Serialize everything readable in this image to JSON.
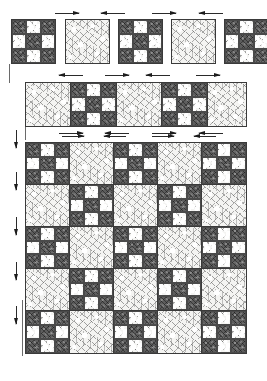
{
  "diagram": {
    "fabrics": {
      "light_label": "light mottled print",
      "light_color": "#f4f4f2",
      "dark_label": "dark speckled print",
      "dark_color": "#5d5d5d",
      "outline_color": "#3a3a3a"
    },
    "block_types": {
      "nine_patch": "nine-patch block",
      "plain": "plain setting square"
    },
    "step_1": {
      "name": "individual blocks row",
      "block_count": 5,
      "sequence": [
        "nine-patch",
        "plain",
        "nine-patch",
        "plain",
        "nine-patch"
      ],
      "arrow_count": 4,
      "arrow_directions": [
        "right",
        "left",
        "right",
        "left"
      ]
    },
    "step_2": {
      "name": "joined block strip",
      "block_count": 5,
      "sequence": [
        "plain",
        "nine-patch",
        "plain",
        "nine-patch",
        "plain"
      ],
      "top_arrow_count": 4,
      "top_arrow_directions": [
        "left",
        "right",
        "left",
        "right"
      ],
      "bottom_arrow_count": 4,
      "bottom_arrow_directions": [
        "right",
        "left",
        "right",
        "left"
      ]
    },
    "step_3": {
      "name": "complete quilt top",
      "columns": 5,
      "rows": 5,
      "layout": [
        [
          "nine-patch",
          "plain",
          "nine-patch",
          "plain",
          "nine-patch"
        ],
        [
          "plain",
          "nine-patch",
          "plain",
          "nine-patch",
          "plain"
        ],
        [
          "nine-patch",
          "plain",
          "nine-patch",
          "plain",
          "nine-patch"
        ],
        [
          "plain",
          "nine-patch",
          "plain",
          "nine-patch",
          "plain"
        ],
        [
          "nine-patch",
          "plain",
          "nine-patch",
          "plain",
          "nine-patch"
        ]
      ],
      "top_arrow_count": 4,
      "top_arrow_directions": [
        "right",
        "left",
        "right",
        "left"
      ],
      "side_arrow_count": 5,
      "side_arrow_directions": [
        "down",
        "down",
        "down",
        "down",
        "down"
      ]
    },
    "nine_patch_cells": [
      "dark",
      "light",
      "dark",
      "light",
      "dark",
      "light",
      "dark",
      "light",
      "dark"
    ]
  }
}
